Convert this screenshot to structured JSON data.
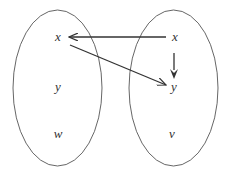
{
  "diagram": {
    "type": "mapping-diagram",
    "left_set": {
      "elements": [
        {
          "label": "x"
        },
        {
          "label": "y"
        },
        {
          "label": "w"
        }
      ]
    },
    "right_set": {
      "elements": [
        {
          "label": "x"
        },
        {
          "label": "y"
        },
        {
          "label": "v"
        }
      ]
    },
    "arrows": [
      {
        "from": "right.x",
        "to": "left.x"
      },
      {
        "from": "left.x",
        "to": "right.y"
      },
      {
        "from": "right.x",
        "to": "right.y"
      }
    ],
    "colors": {
      "stroke": "#555555",
      "arrow": "#333333",
      "text": "#333333",
      "background": "#ffffff"
    }
  }
}
